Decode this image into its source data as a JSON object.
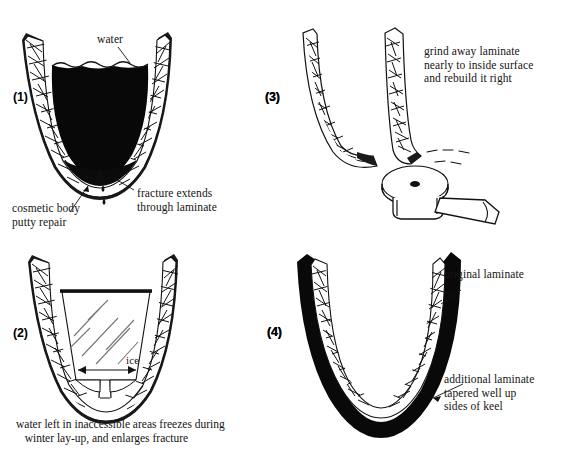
{
  "figure": {
    "background_color": "#ffffff",
    "ink_color": "#111111"
  },
  "panels": [
    {
      "number": "(1)",
      "name": "panel-fractured-hull-with-water",
      "labels": {
        "water": "water",
        "fracture": "fracture extends\nthrough laminate",
        "cosmetic": "cosmetic body\nputty repair"
      }
    },
    {
      "number": "(2)",
      "name": "panel-ice-enlarges-fracture",
      "labels": {
        "ice": "ice"
      },
      "caption": "water left in inaccessible areas freezes during\n   winter lay-up, and enlarges fracture"
    },
    {
      "number": "(3)",
      "name": "panel-grind-away-laminate",
      "labels": {
        "instruction": "grind away laminate\nnearly to inside surface\nand rebuild it right"
      }
    },
    {
      "number": "(4)",
      "name": "panel-rebuilt-keel",
      "labels": {
        "original": "original laminate",
        "additional": "additional laminate\ntapered well up\nsides of keel"
      }
    }
  ]
}
